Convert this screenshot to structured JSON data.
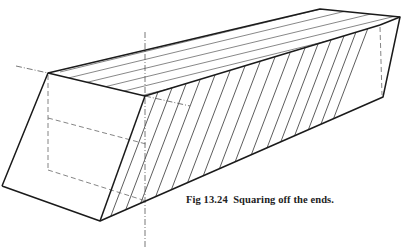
{
  "figure": {
    "caption": "Fig 13.24  Squaring off the ends."
  },
  "colors": {
    "line": "#1a1a1a",
    "construction": "#555555",
    "background": "#ffffff"
  }
}
